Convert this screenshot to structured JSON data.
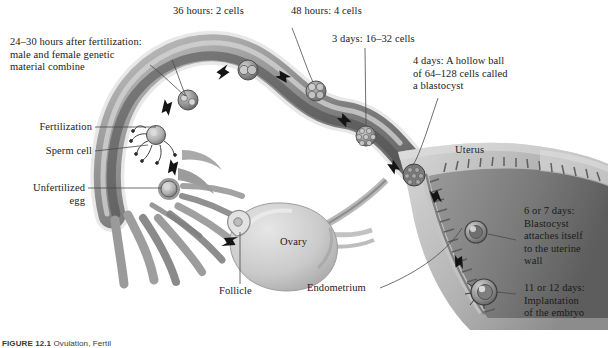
{
  "figure": {
    "caption_number": "FIGURE 12.1",
    "caption_text": "Ovulation, Fertil"
  },
  "callouts": [
    {
      "id": "stage-24-30-hours",
      "text": "24–30 hours after fertilization:\nmale and female genetic\nmaterial combine"
    },
    {
      "id": "stage-36-hours",
      "text": "36 hours: 2 cells"
    },
    {
      "id": "stage-48-hours",
      "text": "48 hours: 4 cells"
    },
    {
      "id": "stage-3-days",
      "text": "3 days: 16–32 cells"
    },
    {
      "id": "stage-4-days",
      "text": "4 days: A hollow ball\nof 64–128 cells called\na blastocyst"
    },
    {
      "id": "stage-6-7-days",
      "text": "6 or 7 days:\nBlastocyst\nattaches itself\nto the uterine\nwall"
    },
    {
      "id": "stage-11-12-days",
      "text": "11 or 12 days:\nImplantation\nof the embryo"
    },
    {
      "id": "fertilization",
      "text": "Fertilization"
    },
    {
      "id": "sperm-cell",
      "text": "Sperm cell"
    },
    {
      "id": "unfertilized-egg",
      "text": "Unfertilized\negg"
    },
    {
      "id": "follicle",
      "text": "Follicle"
    },
    {
      "id": "endometrium",
      "text": "Endometrium"
    }
  ],
  "anatomy": [
    {
      "id": "uterus",
      "text": "Uterus"
    },
    {
      "id": "ovary",
      "text": "Ovary"
    }
  ],
  "colors": {
    "background": "#ffffff",
    "text": "#1a1a1a",
    "leader_line": "#4a4a4a",
    "tube_dark": "#5e5e5e",
    "tube_mid": "#8f8f8f",
    "tube_light": "#c9c9c9",
    "tube_edge": "#e2e2e2",
    "uterus_light": "#cfcfcf",
    "uterus_mid": "#a5a5a5",
    "uterus_dark": "#6f6f6f",
    "ovary": "#d2d2d2",
    "cell_fill": "#9a9a9a",
    "arrow": "#1c1c1c"
  }
}
